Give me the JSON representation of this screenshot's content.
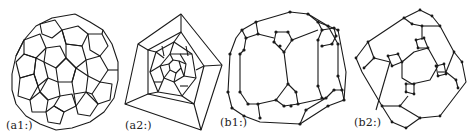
{
  "figure": {
    "panels": [
      {
        "id": "a1",
        "label": "(a1:)",
        "description": "3D-like drawing of a fullerene (C60-like) graph, pentagonal and hexagonal faces"
      },
      {
        "id": "a2",
        "label": "(a2:)",
        "description": "Planar (Schlegel-style) embedding with pentagonal outer face and nested faces shrinking toward center"
      },
      {
        "id": "b1",
        "label": "(b1:)",
        "description": "3D-like drawing of a graph with small triangular clusters of vertices"
      },
      {
        "id": "b2",
        "label": "(b2:)",
        "description": "Planar embedding of the same graph with four inner triangular clusters"
      }
    ],
    "colors": {
      "ink": "#1a1a1a",
      "background": "#ffffff"
    }
  }
}
